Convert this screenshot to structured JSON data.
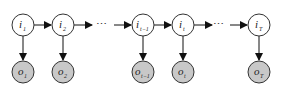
{
  "diagram": {
    "type": "hidden-markov-chain",
    "colors": {
      "hidden_fill": "#ffffff",
      "observed_fill": "#c8c8c8",
      "stroke": "#333333",
      "arrow": "#111111"
    },
    "hidden_nodes": [
      {
        "id": "i1",
        "base": "i",
        "sub": "1",
        "cx": 23
      },
      {
        "id": "i2",
        "base": "i",
        "sub": "2",
        "cx": 63
      },
      {
        "id": "it-1",
        "base": "i",
        "sub": "t−1",
        "cx": 143
      },
      {
        "id": "it",
        "base": "i",
        "sub": "t",
        "cx": 183
      },
      {
        "id": "iT",
        "base": "i",
        "sub": "T",
        "cx": 259
      }
    ],
    "observed_nodes": [
      {
        "id": "o1",
        "base": "o",
        "sub": "1",
        "cx": 23
      },
      {
        "id": "o2",
        "base": "o",
        "sub": "2",
        "cx": 63
      },
      {
        "id": "ot-1",
        "base": "o",
        "sub": "t−1",
        "cx": 143
      },
      {
        "id": "ot",
        "base": "o",
        "sub": "t",
        "cx": 183
      },
      {
        "id": "oT",
        "base": "o",
        "sub": "T",
        "cx": 259
      }
    ],
    "ellipsis": [
      "⋯",
      "⋯"
    ]
  }
}
